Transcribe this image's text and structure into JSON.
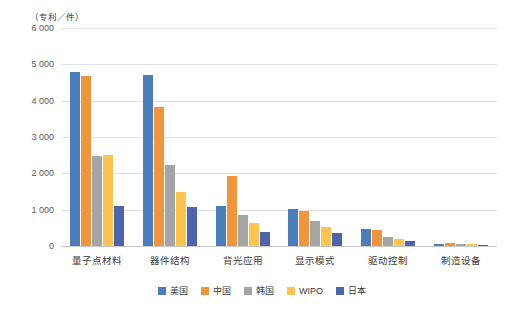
{
  "chart_data": {
    "type": "bar",
    "title": "",
    "subtitle": "",
    "unit_label": "（专利／件）",
    "xlabel": "",
    "ylabel": "",
    "ylim": [
      0,
      6000
    ],
    "yticks": [
      "6 000",
      "5 000",
      "4 000",
      "3 000",
      "2 000",
      "1 000",
      "0"
    ],
    "ytick_values": [
      6000,
      5000,
      4000,
      3000,
      2000,
      1000,
      0
    ],
    "grid": true,
    "legend_position": "bottom",
    "categories": [
      "量子点材料",
      "器件结构",
      "背光应用",
      "显示模式",
      "驱动控制",
      "制造设备"
    ],
    "series": [
      {
        "name": "美国",
        "color": "#4a7ebb",
        "values": [
          4800,
          4700,
          1100,
          1020,
          480,
          60
        ]
      },
      {
        "name": "中国",
        "color": "#f0953c",
        "values": [
          4680,
          3820,
          1930,
          960,
          430,
          90
        ]
      },
      {
        "name": "韩国",
        "color": "#a5a5a5",
        "values": [
          2480,
          2240,
          840,
          700,
          240,
          60
        ]
      },
      {
        "name": "WIPO",
        "color": "#ffc44d",
        "values": [
          2500,
          1500,
          620,
          530,
          200,
          50
        ]
      },
      {
        "name": "日本",
        "color": "#4e63ae",
        "values": [
          1100,
          1080,
          380,
          360,
          130,
          40
        ]
      }
    ]
  }
}
